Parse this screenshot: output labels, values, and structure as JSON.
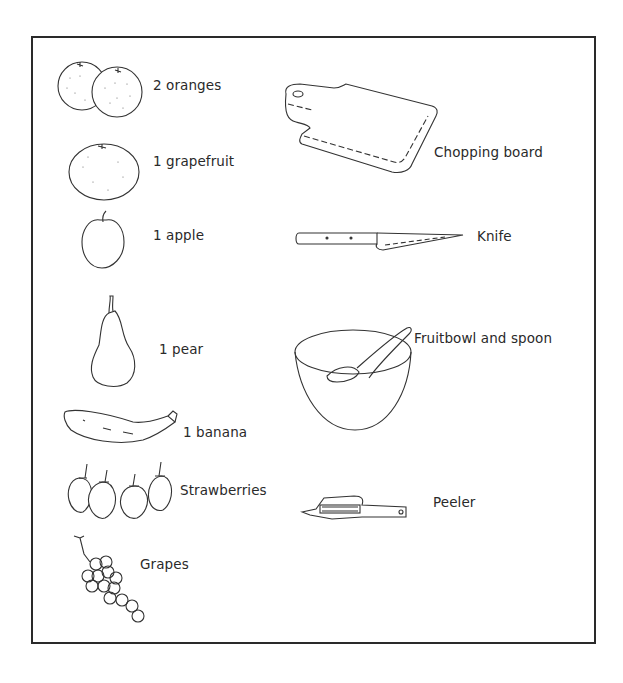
{
  "worksheet": {
    "fruits": [
      {
        "id": "oranges",
        "label": "2 oranges"
      },
      {
        "id": "grapefruit",
        "label": "1 grapefruit"
      },
      {
        "id": "apple",
        "label": "1 apple"
      },
      {
        "id": "pear",
        "label": "1 pear"
      },
      {
        "id": "banana",
        "label": "1 banana"
      },
      {
        "id": "strawberries",
        "label": "Strawberries"
      },
      {
        "id": "grapes",
        "label": "Grapes"
      }
    ],
    "utensils": [
      {
        "id": "chopping-board",
        "label": "Chopping board"
      },
      {
        "id": "knife",
        "label": "Knife"
      },
      {
        "id": "fruitbowl-spoon",
        "label": "Fruitbowl and spoon"
      },
      {
        "id": "peeler",
        "label": "Peeler"
      }
    ]
  }
}
